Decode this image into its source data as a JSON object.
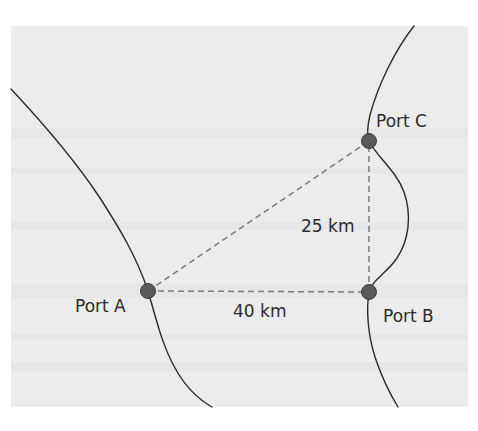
{
  "diagram": {
    "title": "",
    "colors": {
      "page_background": "#ffffff",
      "panel_background": "#ececec",
      "coastline": "#2a2a2a",
      "route_dashed": "#7a7a7a",
      "port_dot": "#5a5a5a"
    },
    "ports": [
      {
        "id": "A",
        "label": "Port A",
        "x": 148,
        "y": 291
      },
      {
        "id": "B",
        "label": "Port B",
        "x": 369,
        "y": 292
      },
      {
        "id": "C",
        "label": "Port C",
        "x": 369,
        "y": 141
      }
    ],
    "routes": [
      {
        "from": "A",
        "to": "B",
        "distance_label": "40 km"
      },
      {
        "from": "B",
        "to": "C",
        "distance_label": "25 km"
      },
      {
        "from": "A",
        "to": "C",
        "distance_label": ""
      }
    ],
    "labels": {
      "port_a": "Port A",
      "port_b": "Port B",
      "port_c": "Port C",
      "distance_ab": "40 km",
      "distance_bc": "25 km"
    }
  }
}
